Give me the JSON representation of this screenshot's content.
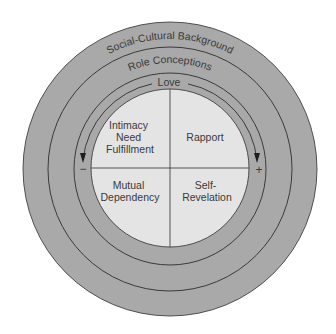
{
  "diagram": {
    "rings": {
      "outer": "Social-Cultural Background",
      "middle": "Role Conceptions",
      "inner": "Love"
    },
    "quadrants": {
      "top_left": [
        "Intimacy",
        "Need",
        "Fulfillment"
      ],
      "top_right": [
        "Rapport"
      ],
      "bottom_left": [
        "Mutual",
        "Dependency"
      ],
      "bottom_right": [
        "Self-",
        "Revelation"
      ]
    },
    "signs": {
      "left": "−",
      "right": "+"
    },
    "colors": {
      "ring_fill": "#a9a9a9",
      "disc_fill": "#e4e4e4",
      "line": "#2e2e2e",
      "background": "#ffffff"
    }
  }
}
